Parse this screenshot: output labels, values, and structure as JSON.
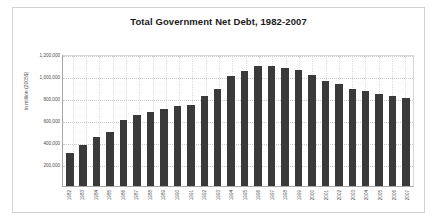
{
  "chart_data": {
    "type": "bar",
    "title": "Total Government Net Debt, 1982-2007",
    "xlabel": "",
    "ylabel": "In million (2005$)",
    "ylim": [
      0,
      1200000
    ],
    "yticks": [
      "1,200,000",
      "1,000,000",
      "800,000",
      "600,000",
      "400,000",
      "200,000"
    ],
    "ytick_values": [
      1200000,
      1000000,
      800000,
      600000,
      400000,
      200000
    ],
    "grid": true,
    "legend": "none",
    "bar_color": "#3a3a3a",
    "categories": [
      "1982",
      "1983",
      "1984",
      "1985",
      "1986",
      "1987",
      "1988",
      "1989",
      "1990",
      "1991",
      "1992",
      "1993",
      "1994",
      "1995",
      "1996",
      "1997",
      "1998",
      "1999",
      "2000",
      "2001",
      "2002",
      "2003",
      "2004",
      "2005",
      "2006",
      "2007"
    ],
    "values": [
      300000,
      375000,
      445000,
      495000,
      600000,
      645000,
      675000,
      700000,
      730000,
      740000,
      815000,
      880000,
      1000000,
      1045000,
      1095000,
      1095000,
      1075000,
      1055000,
      1010000,
      955000,
      930000,
      880000,
      865000,
      840000,
      820000,
      800000
    ]
  }
}
